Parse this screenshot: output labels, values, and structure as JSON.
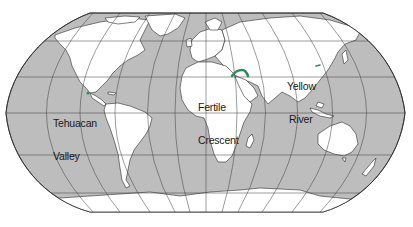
{
  "map": {
    "projection": "Robinson",
    "colors": {
      "ocean": "#bdbdbd",
      "land": "#ffffff",
      "outline": "#2b2b2b",
      "graticule": "#3a3a3a",
      "highlight": "#2e8b57",
      "background": "#ffffff"
    },
    "labels": [
      {
        "id": "tehuacan-valley",
        "line1": "Tehuacan",
        "line2": "Valley"
      },
      {
        "id": "fertile-crescent",
        "line1": "Fertile",
        "line2": "Crescent"
      },
      {
        "id": "yellow-river",
        "line1": "Yellow",
        "line2": "River"
      }
    ]
  }
}
